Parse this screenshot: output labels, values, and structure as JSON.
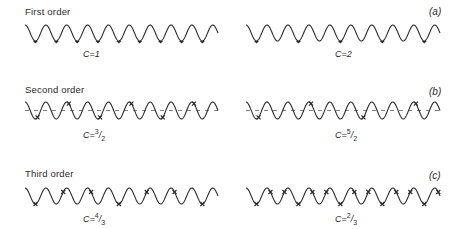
{
  "figure": {
    "rows": [
      {
        "title": "First order",
        "tag": "(a)",
        "panels": [
          {
            "label": "C=1",
            "cycles": 9,
            "x0": 25,
            "x1": 218,
            "yTop": 25,
            "yBot": 41,
            "labelX": 83,
            "labelY": 49,
            "markers": {
              "every": 1,
              "offset": 0,
              "type": "dot",
              "at": "trough"
            },
            "dashed": false
          },
          {
            "label": "C=2",
            "cycles": 9,
            "x0": 246,
            "x1": 440,
            "yTop": 25,
            "yBot": 41,
            "labelX": 335,
            "labelY": 49,
            "markers": {
              "every": 2,
              "offset": 0,
              "type": "dot",
              "at": "trough"
            },
            "dashed": false
          }
        ]
      },
      {
        "title": "Second order",
        "tag": "(b)",
        "panels": [
          {
            "label": "C=3/2",
            "cycles": 9,
            "x0": 25,
            "x1": 218,
            "yTop": 102,
            "yBot": 119,
            "labelX": 83,
            "labelY": 128,
            "markers": {
              "every": 1.5,
              "offset": 0.1,
              "type": "cross",
              "at": "phase"
            },
            "dashed": true
          },
          {
            "label": "C=5/2",
            "cycles": 9,
            "x0": 246,
            "x1": 440,
            "yTop": 102,
            "yBot": 119,
            "labelX": 335,
            "labelY": 128,
            "markers": {
              "every": 2.5,
              "offset": 0.1,
              "type": "cross",
              "at": "phase"
            },
            "dashed": true
          }
        ]
      },
      {
        "title": "Third order",
        "tag": "(c)",
        "panels": [
          {
            "label": "C=4/3",
            "cycles": 9,
            "x0": 25,
            "x1": 218,
            "yTop": 188,
            "yBot": 204,
            "labelX": 83,
            "labelY": 212,
            "markers": {
              "every": 1.3333,
              "offset": 0,
              "type": "cross",
              "at": "phase"
            },
            "dashed": false
          },
          {
            "label": "C=2/3",
            "cycles": 9,
            "x0": 246,
            "x1": 440,
            "yTop": 188,
            "yBot": 204,
            "labelX": 335,
            "labelY": 212,
            "markers": {
              "every": 0.6667,
              "offset": 0,
              "type": "cross",
              "at": "phase"
            },
            "dashed": false
          }
        ]
      }
    ],
    "labels": {
      "row1_title": "First order",
      "row2_title": "Second order",
      "row3_title": "Third order",
      "tag_a": "(a)",
      "tag_b": "(b)",
      "tag_c": "(c)",
      "c1_prefix": "C=",
      "c1_value": "1",
      "c2_prefix": "C=",
      "c2_value": "2",
      "c3_prefix": "C=",
      "c3_num": "3",
      "c3_den": "2",
      "c4_prefix": "C=",
      "c4_num": "5",
      "c4_den": "2",
      "c5_prefix": "C=",
      "c5_num": "4",
      "c5_den": "3",
      "c6_prefix": "C=",
      "c6_num": "2",
      "c6_den": "3"
    },
    "style": {
      "stroke": "#2a2a2a"
    }
  }
}
